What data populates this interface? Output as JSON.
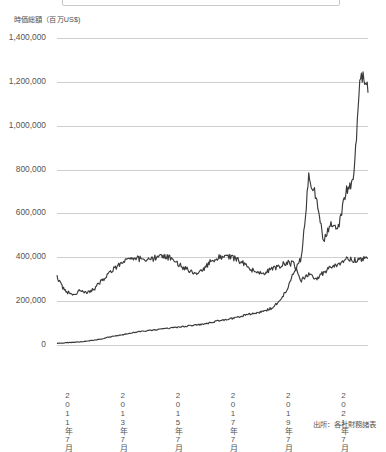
{
  "axis": {
    "y_title": "時価総額（百万US$)",
    "y_ticks": [
      "1,400,000",
      "1,200,000",
      "1,000,000",
      "800,000",
      "600,000",
      "400,000",
      "200,000",
      "0"
    ],
    "y_tick_values": [
      1400000,
      1200000,
      1000000,
      800000,
      600000,
      400000,
      200000,
      0
    ],
    "x_ticks": [
      "2011年7月",
      "2013年7月",
      "2015年7月",
      "2017年7月",
      "2019年7月",
      "2021年7月"
    ]
  },
  "footer": {
    "source": "出所：各社財務諸表"
  },
  "colors": {
    "line": "#3a3a3a",
    "grid": "#cfcfcf",
    "text": "#555555",
    "background": "#ffffff"
  },
  "chart_data": {
    "type": "line",
    "title": "",
    "subtitle": "",
    "xlabel": "",
    "ylabel": "時価総額（百万US$)",
    "ylim": [
      0,
      1400000
    ],
    "xlim": [
      "2011-07",
      "2021-12"
    ],
    "grid": true,
    "legend_position": "top",
    "annotations": [],
    "x_tick_labels": [
      "2011年7月",
      "2013年7月",
      "2015年7月",
      "2017年7月",
      "2019年7月",
      "2021年7月"
    ],
    "x": [
      "2011-07",
      "2011-10",
      "2012-01",
      "2012-04",
      "2012-07",
      "2012-10",
      "2013-01",
      "2013-04",
      "2013-07",
      "2013-10",
      "2014-01",
      "2014-04",
      "2014-07",
      "2014-10",
      "2015-01",
      "2015-04",
      "2015-07",
      "2015-10",
      "2016-01",
      "2016-04",
      "2016-07",
      "2016-10",
      "2017-01",
      "2017-04",
      "2017-07",
      "2017-10",
      "2018-01",
      "2018-04",
      "2018-07",
      "2018-10",
      "2019-01",
      "2019-04",
      "2019-07",
      "2019-10",
      "2020-01",
      "2020-04",
      "2020-07",
      "2020-10",
      "2021-01",
      "2021-04",
      "2021-07",
      "2021-10",
      "2021-12"
    ],
    "series": [
      {
        "name": "series-a",
        "values": [
          310000,
          250000,
          230000,
          245000,
          235000,
          255000,
          290000,
          330000,
          355000,
          380000,
          400000,
          395000,
          380000,
          395000,
          410000,
          400000,
          385000,
          350000,
          340000,
          330000,
          355000,
          390000,
          400000,
          405000,
          395000,
          375000,
          350000,
          330000,
          330000,
          345000,
          360000,
          375000,
          370000,
          295000,
          320000,
          300000,
          330000,
          360000,
          370000,
          395000,
          385000,
          390000,
          395000
        ]
      },
      {
        "name": "series-b",
        "values": [
          8000,
          10000,
          12000,
          14000,
          18000,
          22000,
          28000,
          36000,
          42000,
          48000,
          55000,
          60000,
          64000,
          68000,
          72000,
          76000,
          80000,
          84000,
          88000,
          92000,
          96000,
          104000,
          112000,
          118000,
          124000,
          132000,
          140000,
          148000,
          155000,
          168000,
          200000,
          250000,
          330000,
          400000,
          760000,
          680000,
          470000,
          560000,
          540000,
          700000,
          740000,
          1230000,
          1150000
        ]
      }
    ]
  }
}
